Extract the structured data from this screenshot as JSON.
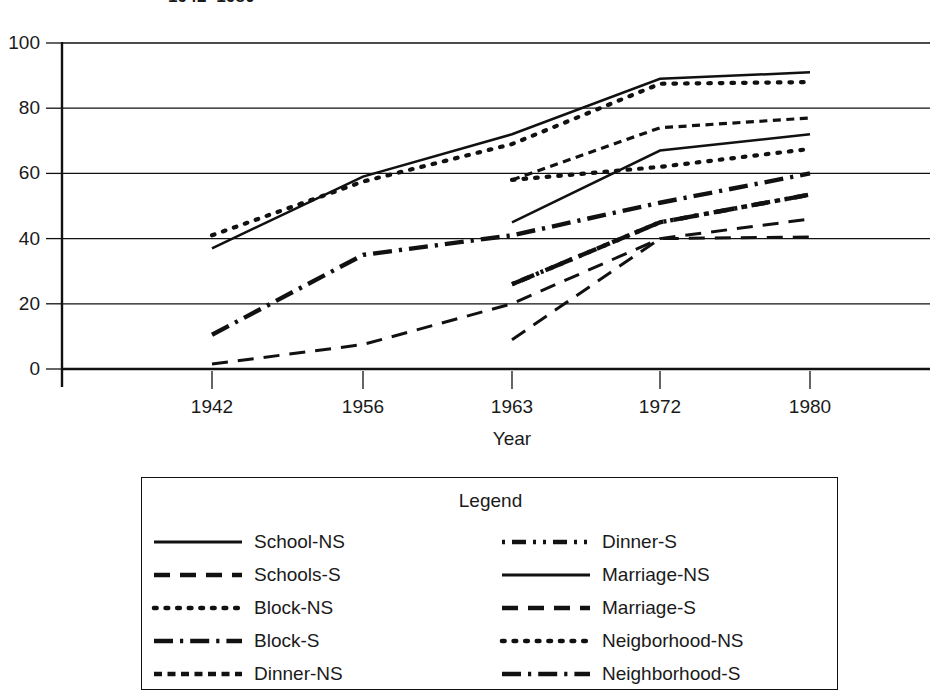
{
  "title": "1942–1980",
  "axes": {
    "xlabel": "Year",
    "ylabel": "",
    "yticks": [
      "0",
      "20",
      "40",
      "60",
      "80",
      "100"
    ],
    "xticks": [
      "1942",
      "1956",
      "1963",
      "1972",
      "1980"
    ]
  },
  "legend": {
    "title": "Legend",
    "left_items": [
      {
        "label": "School-NS",
        "style": "solid"
      },
      {
        "label": "Schools-S",
        "style": "dashed"
      },
      {
        "label": "Block-NS",
        "style": "dotted"
      },
      {
        "label": "Block-S",
        "style": "dashdot"
      },
      {
        "label": "Dinner-NS",
        "style": "finedash"
      }
    ],
    "right_items": [
      {
        "label": "Dinner-S",
        "style": "dashdotdot"
      },
      {
        "label": "Marriage-NS",
        "style": "solid"
      },
      {
        "label": "Marriage-S",
        "style": "dashed"
      },
      {
        "label": "Neigborhood-NS",
        "style": "dotted"
      },
      {
        "label": "Neighborhood-S",
        "style": "dashdot"
      }
    ]
  },
  "chart_data": {
    "type": "line",
    "title": "1942–1980",
    "xlabel": "Year",
    "ylabel": "",
    "categories": [
      "1942",
      "1956",
      "1963",
      "1972",
      "1980"
    ],
    "ylim": [
      0,
      100
    ],
    "yticks": [
      0,
      20,
      40,
      60,
      80,
      100
    ],
    "grid": "horizontal",
    "legend_position": "below",
    "line_color": "#111111",
    "series": [
      {
        "name": "School-NS",
        "style": "solid",
        "values": [
          37,
          59,
          72,
          89,
          91
        ]
      },
      {
        "name": "Schools-S",
        "style": "dashed",
        "values": [
          1.5,
          7.5,
          20,
          40,
          46
        ]
      },
      {
        "name": "Block-NS",
        "style": "dotted",
        "values": [
          41,
          57.5,
          69,
          87.5,
          88
        ]
      },
      {
        "name": "Block-S",
        "style": "dashdot",
        "values": [
          10.5,
          35,
          41,
          51,
          60
        ]
      },
      {
        "name": "Dinner-NS",
        "style": "finedash",
        "values": [
          null,
          null,
          58,
          74,
          77
        ]
      },
      {
        "name": "Dinner-S",
        "style": "dashdotdot",
        "values": [
          null,
          null,
          26,
          45,
          53.5
        ]
      },
      {
        "name": "Marriage-NS",
        "style": "solid",
        "values": [
          null,
          null,
          45,
          67,
          72
        ]
      },
      {
        "name": "Marriage-S",
        "style": "dashed",
        "values": [
          null,
          null,
          9,
          40,
          40.5
        ]
      },
      {
        "name": "Neigborhood-NS",
        "style": "dotted",
        "values": [
          null,
          null,
          58,
          62,
          67.5
        ]
      },
      {
        "name": "Neighborhood-S",
        "style": "dashdot",
        "values": [
          null,
          null,
          26,
          45,
          53.5
        ]
      }
    ]
  }
}
